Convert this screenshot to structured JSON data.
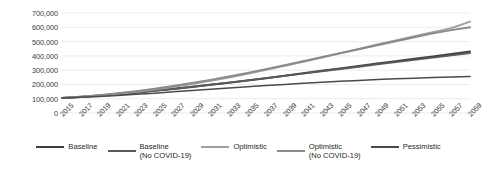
{
  "chart_data": {
    "type": "line",
    "title": "",
    "xlabel": "",
    "ylabel": "",
    "ylim": [
      0,
      700000
    ],
    "ytick_values": [
      0,
      100000,
      200000,
      300000,
      400000,
      500000,
      600000,
      700000
    ],
    "ytick_labels": [
      "0",
      "100,000",
      "200,000",
      "300,000",
      "400,000",
      "500,000",
      "600,000",
      "700,000"
    ],
    "grid": true,
    "legend_position": "bottom",
    "x": [
      2015,
      2017,
      2019,
      2021,
      2023,
      2025,
      2027,
      2029,
      2031,
      2033,
      2035,
      2037,
      2039,
      2041,
      2043,
      2045,
      2047,
      2049,
      2051,
      2053,
      2055,
      2057,
      2059
    ],
    "xtick_labels": [
      "2015",
      "2017",
      "2019",
      "2021",
      "2023",
      "2025",
      "2027",
      "2029",
      "2031",
      "2033",
      "2035",
      "2037",
      "2039",
      "2041",
      "2043",
      "2045",
      "2047",
      "2049",
      "2051",
      "2053",
      "2055",
      "2057",
      "2059"
    ],
    "series": [
      {
        "name": "Baseline",
        "color": "#3f3f3f",
        "width": 2.0,
        "values": [
          105000,
          112000,
          120000,
          130000,
          142000,
          155000,
          168000,
          182000,
          197000,
          212000,
          228000,
          244000,
          261000,
          278000,
          295000,
          312000,
          329000,
          346000,
          362000,
          379000,
          396000,
          413000,
          430000
        ]
      },
      {
        "name": "Baseline (No COVID-19)",
        "color": "#5a5a5a",
        "width": 1.9,
        "values": [
          105000,
          113000,
          122000,
          132000,
          144000,
          157000,
          170000,
          184000,
          198000,
          213000,
          228000,
          244000,
          260000,
          276000,
          292000,
          308000,
          324000,
          340000,
          356000,
          372000,
          388000,
          404000,
          420000
        ]
      },
      {
        "name": "Optimistic",
        "color": "#9e9e9e",
        "width": 2.0,
        "values": [
          105000,
          113000,
          123000,
          135000,
          149000,
          165000,
          183000,
          203000,
          225000,
          249000,
          275000,
          302000,
          330000,
          359000,
          389000,
          419000,
          449000,
          479000,
          508000,
          537000,
          566000,
          594000,
          640000
        ]
      },
      {
        "name": "Optimistic (No COVID-19)",
        "color": "#8a8a8a",
        "width": 1.9,
        "values": [
          105000,
          114000,
          125000,
          138000,
          153000,
          170000,
          189000,
          210000,
          232000,
          256000,
          281000,
          307000,
          334000,
          362000,
          390000,
          418000,
          446000,
          474000,
          502000,
          530000,
          557000,
          580000,
          600000
        ]
      },
      {
        "name": "Pessimistic",
        "color": "#4a4a4a",
        "width": 1.5,
        "values": [
          105000,
          110000,
          116000,
          123000,
          131000,
          139000,
          148000,
          157000,
          166000,
          175000,
          184000,
          192000,
          200000,
          208000,
          215000,
          222000,
          228000,
          234000,
          239000,
          244000,
          248000,
          252000,
          255000
        ]
      }
    ]
  },
  "legend": {
    "items": [
      {
        "label": "Baseline",
        "color": "#3f3f3f"
      },
      {
        "label": "Baseline\n(No COVID-19)",
        "color": "#5a5a5a"
      },
      {
        "label": "Optimistic",
        "color": "#9e9e9e"
      },
      {
        "label": "Optimistic\n(No COVID-19)",
        "color": "#8a8a8a"
      },
      {
        "label": "Pessimistic",
        "color": "#4a4a4a"
      }
    ]
  }
}
